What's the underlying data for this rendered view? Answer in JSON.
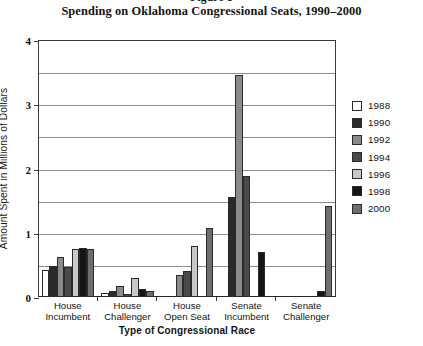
{
  "figure": {
    "label": "Figure 1",
    "title": "Spending on Oklahoma Congressional Seats, 1990–2000"
  },
  "axes": {
    "y_title": "Amount Spent in Millions of Dollars",
    "x_title": "Type of Congressional Race",
    "y_ticks": [
      "0",
      "1",
      "2",
      "3",
      "4"
    ]
  },
  "legend": {
    "position": "right",
    "items": [
      {
        "label": "1988",
        "color": "#ffffff"
      },
      {
        "label": "1990",
        "color": "#2a2a2a"
      },
      {
        "label": "1992",
        "color": "#8a8a8a"
      },
      {
        "label": "1994",
        "color": "#4a4a4a"
      },
      {
        "label": "1996",
        "color": "#c8c8c8"
      },
      {
        "label": "1998",
        "color": "#151515"
      },
      {
        "label": "2000",
        "color": "#6e6e6e"
      }
    ]
  },
  "chart_data": {
    "type": "bar",
    "title": "Spending on Oklahoma Congressional Seats, 1990–2000",
    "subtitle": "Figure 1",
    "xlabel": "Type of Congressional Race",
    "ylabel": "Amount Spent in Millions of Dollars",
    "ylim": [
      0,
      4
    ],
    "yticks": [
      0,
      1,
      2,
      3,
      4
    ],
    "grid": true,
    "legend_position": "right",
    "categories": [
      "House Incumbent",
      "House Challenger",
      "House Open Seat",
      "Senate Incumbent",
      "Senate Challenger"
    ],
    "category_lines": [
      [
        "House",
        "Incumbent"
      ],
      [
        "House",
        "Challenger"
      ],
      [
        "House",
        "Open Seat"
      ],
      [
        "Senate",
        "Incumbent"
      ],
      [
        "Senate",
        "Challenger"
      ]
    ],
    "series": [
      {
        "name": "1988",
        "color": "#ffffff",
        "values": [
          0.42,
          0.06,
          0,
          0,
          0
        ]
      },
      {
        "name": "1990",
        "color": "#2a2a2a",
        "values": [
          0.48,
          0.1,
          0,
          1.55,
          0
        ]
      },
      {
        "name": "1992",
        "color": "#8a8a8a",
        "values": [
          0.62,
          0.17,
          0.35,
          3.45,
          0
        ]
      },
      {
        "name": "1994",
        "color": "#4a4a4a",
        "values": [
          0.47,
          0.05,
          0.4,
          1.88,
          0
        ]
      },
      {
        "name": "1996",
        "color": "#c8c8c8",
        "values": [
          0.75,
          0.3,
          0.8,
          0,
          0
        ]
      },
      {
        "name": "1998",
        "color": "#151515",
        "values": [
          0.76,
          0.12,
          0,
          0.7,
          0.1
        ]
      },
      {
        "name": "2000",
        "color": "#6e6e6e",
        "values": [
          0.75,
          0.09,
          1.08,
          0,
          1.42
        ]
      }
    ]
  }
}
